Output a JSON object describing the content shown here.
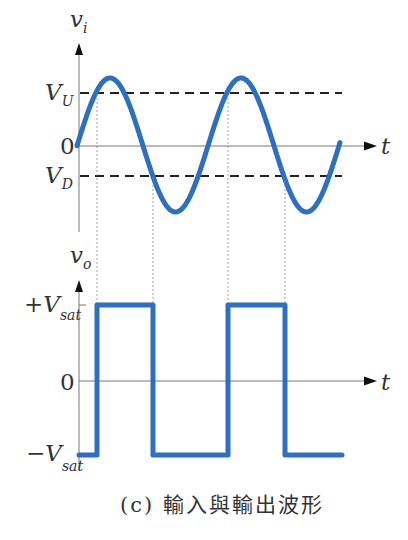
{
  "figure": {
    "caption": "(c) 輸入與輸出波形",
    "wave_color": "#2f6fbf",
    "input_plot": {
      "y_axis_label": "v",
      "y_axis_sub": "i",
      "x_axis_label": "t",
      "zero_label": "0",
      "upper_threshold_label": "V",
      "upper_threshold_sub": "U",
      "lower_threshold_label": "V",
      "lower_threshold_sub": "D",
      "signal": "sine"
    },
    "output_plot": {
      "y_axis_label": "v",
      "y_axis_sub": "o",
      "x_axis_label": "t",
      "zero_label": "0",
      "high_label": "+V",
      "high_sub": "sat",
      "low_label": "−V",
      "low_sub": "sat",
      "signal": "square"
    }
  }
}
